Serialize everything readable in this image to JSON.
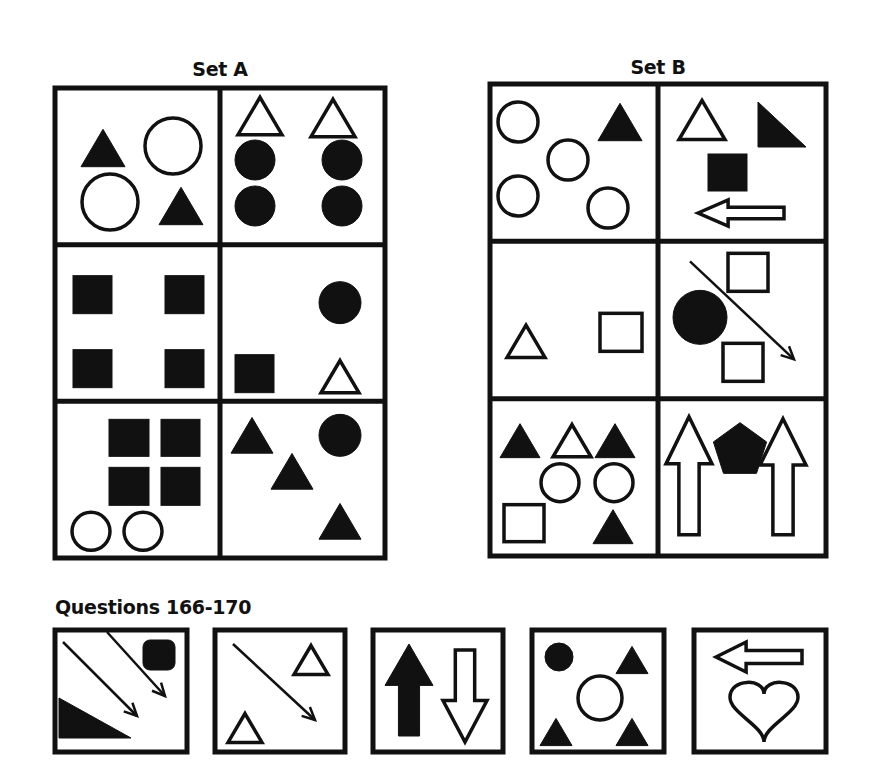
{
  "set_a": {
    "title": "Set A",
    "box": {
      "x": 55,
      "y": 88,
      "w": 330,
      "h": 470
    },
    "panels": [
      {
        "name": "a1",
        "shapes": [
          {
            "t": "tri",
            "cx": 48,
            "cy": 60,
            "s": 44,
            "fill": true
          },
          {
            "t": "circle",
            "cx": 118,
            "cy": 58,
            "r": 28,
            "fill": false
          },
          {
            "t": "circle",
            "cx": 55,
            "cy": 114,
            "r": 28,
            "fill": false
          },
          {
            "t": "tri",
            "cx": 126,
            "cy": 118,
            "s": 44,
            "fill": true
          }
        ]
      },
      {
        "name": "a2",
        "shapes": [
          {
            "t": "tri",
            "cx": 40,
            "cy": 28,
            "s": 44,
            "fill": false
          },
          {
            "t": "tri",
            "cx": 113,
            "cy": 30,
            "s": 44,
            "fill": false
          },
          {
            "t": "circle",
            "cx": 35,
            "cy": 72,
            "r": 20,
            "fill": true
          },
          {
            "t": "circle",
            "cx": 122,
            "cy": 72,
            "r": 20,
            "fill": true
          },
          {
            "t": "circle",
            "cx": 35,
            "cy": 118,
            "r": 20,
            "fill": true
          },
          {
            "t": "circle",
            "cx": 122,
            "cy": 118,
            "r": 20,
            "fill": true
          }
        ]
      },
      {
        "name": "a3",
        "shapes": [
          {
            "t": "rect",
            "x": 18,
            "y": 31,
            "w": 39,
            "h": 38,
            "fill": true
          },
          {
            "t": "rect",
            "x": 110,
            "y": 31,
            "w": 39,
            "h": 38,
            "fill": true
          },
          {
            "t": "rect",
            "x": 18,
            "y": 105,
            "w": 39,
            "h": 38,
            "fill": true
          },
          {
            "t": "rect",
            "x": 110,
            "y": 105,
            "w": 39,
            "h": 38,
            "fill": true
          }
        ]
      },
      {
        "name": "a4",
        "shapes": [
          {
            "t": "circle",
            "cx": 120,
            "cy": 58,
            "r": 21,
            "fill": true
          },
          {
            "t": "rect",
            "x": 15,
            "y": 110,
            "w": 39,
            "h": 38,
            "fill": true
          },
          {
            "t": "tri",
            "cx": 120,
            "cy": 132,
            "s": 38,
            "fill": false
          }
        ]
      },
      {
        "name": "a5",
        "shapes": [
          {
            "t": "rect",
            "x": 54,
            "y": 18,
            "w": 40,
            "h": 37,
            "fill": true
          },
          {
            "t": "rect",
            "x": 106,
            "y": 18,
            "w": 39,
            "h": 37,
            "fill": true
          },
          {
            "t": "rect",
            "x": 54,
            "y": 66,
            "w": 40,
            "h": 38,
            "fill": true
          },
          {
            "t": "rect",
            "x": 106,
            "y": 66,
            "w": 39,
            "h": 38,
            "fill": true
          },
          {
            "t": "circle",
            "cx": 36,
            "cy": 130,
            "r": 19,
            "fill": false
          },
          {
            "t": "circle",
            "cx": 88,
            "cy": 130,
            "r": 19,
            "fill": false
          }
        ]
      },
      {
        "name": "a6",
        "shapes": [
          {
            "t": "tri",
            "cx": 32,
            "cy": 34,
            "s": 42,
            "fill": true
          },
          {
            "t": "circle",
            "cx": 120,
            "cy": 34,
            "r": 21,
            "fill": true
          },
          {
            "t": "tri",
            "cx": 72,
            "cy": 70,
            "s": 42,
            "fill": true
          },
          {
            "t": "tri",
            "cx": 120,
            "cy": 120,
            "s": 42,
            "fill": true
          }
        ]
      }
    ]
  },
  "set_b": {
    "title": "Set B",
    "box": {
      "x": 490,
      "y": 84,
      "w": 336,
      "h": 472
    },
    "panels": [
      {
        "name": "b1",
        "shapes": [
          {
            "t": "circle",
            "cx": 28,
            "cy": 38,
            "r": 20,
            "fill": false
          },
          {
            "t": "tri",
            "cx": 130,
            "cy": 38,
            "s": 44,
            "fill": true
          },
          {
            "t": "circle",
            "cx": 78,
            "cy": 76,
            "r": 20,
            "fill": false
          },
          {
            "t": "circle",
            "cx": 28,
            "cy": 112,
            "r": 20,
            "fill": false
          },
          {
            "t": "circle",
            "cx": 118,
            "cy": 124,
            "r": 20,
            "fill": false
          }
        ]
      },
      {
        "name": "b2",
        "shapes": [
          {
            "t": "tri",
            "cx": 44,
            "cy": 36,
            "s": 46,
            "fill": false
          },
          {
            "t": "rtri",
            "x": 100,
            "y": 18,
            "w": 48,
            "h": 45,
            "fill": true
          },
          {
            "t": "rect",
            "x": 50,
            "y": 70,
            "w": 39,
            "h": 37,
            "fill": true
          },
          {
            "t": "arrow_left_outline",
            "x": 40,
            "y": 116,
            "w": 86,
            "h": 26
          }
        ]
      },
      {
        "name": "b3",
        "shapes": [
          {
            "t": "tri",
            "cx": 36,
            "cy": 100,
            "s": 38,
            "fill": false
          },
          {
            "t": "rect",
            "x": 110,
            "y": 72,
            "w": 42,
            "h": 38,
            "fill": false
          }
        ]
      },
      {
        "name": "b4",
        "shapes": [
          {
            "t": "rect",
            "x": 70,
            "y": 12,
            "w": 40,
            "h": 38,
            "fill": false
          },
          {
            "t": "circle",
            "cx": 42,
            "cy": 76,
            "r": 27,
            "fill": true
          },
          {
            "t": "line_arrow",
            "x1": 32,
            "y1": 20,
            "x2": 136,
            "y2": 118
          },
          {
            "t": "rect",
            "x": 65,
            "y": 102,
            "w": 40,
            "h": 38,
            "fill": false
          }
        ]
      },
      {
        "name": "b5",
        "shapes": [
          {
            "t": "tri",
            "cx": 30,
            "cy": 42,
            "s": 40,
            "fill": true
          },
          {
            "t": "tri",
            "cx": 82,
            "cy": 42,
            "s": 38,
            "fill": false
          },
          {
            "t": "tri",
            "cx": 125,
            "cy": 42,
            "s": 40,
            "fill": true
          },
          {
            "t": "circle",
            "cx": 70,
            "cy": 84,
            "r": 19,
            "fill": false
          },
          {
            "t": "circle",
            "cx": 124,
            "cy": 84,
            "r": 19,
            "fill": false
          },
          {
            "t": "rect",
            "x": 14,
            "y": 106,
            "w": 40,
            "h": 37,
            "fill": false
          },
          {
            "t": "tri",
            "cx": 123,
            "cy": 128,
            "s": 40,
            "fill": true
          }
        ]
      },
      {
        "name": "b6",
        "shapes": [
          {
            "t": "arrow_up_outline",
            "x": 8,
            "y": 18,
            "w": 46,
            "h": 118
          },
          {
            "t": "pentagon",
            "cx": 82,
            "cy": 52,
            "r": 28,
            "fill": true
          },
          {
            "t": "arrow_up_outline",
            "x": 102,
            "y": 20,
            "w": 46,
            "h": 116
          }
        ]
      }
    ]
  },
  "questions": {
    "title": "Questions 166-170",
    "items": [
      {
        "number": 166,
        "box": {
          "x": 55,
          "y": 630,
          "w": 132,
          "h": 122
        },
        "shapes": [
          {
            "t": "line_arrow",
            "x1": 8,
            "y1": 12,
            "x2": 82,
            "y2": 86
          },
          {
            "t": "line_arrow",
            "x1": 52,
            "y1": 2,
            "x2": 110,
            "y2": 66
          },
          {
            "t": "rrect",
            "x": 88,
            "y": 10,
            "w": 32,
            "h": 30,
            "fill": true
          },
          {
            "t": "rtri_bl",
            "x": 4,
            "y": 68,
            "w": 72,
            "h": 40,
            "fill": true
          }
        ]
      },
      {
        "number": 167,
        "box": {
          "x": 215,
          "y": 630,
          "w": 130,
          "h": 122
        },
        "shapes": [
          {
            "t": "line_arrow",
            "x1": 18,
            "y1": 14,
            "x2": 100,
            "y2": 90
          },
          {
            "t": "tri",
            "cx": 96,
            "cy": 30,
            "s": 34,
            "fill": false
          },
          {
            "t": "tri",
            "cx": 30,
            "cy": 98,
            "s": 34,
            "fill": false
          }
        ]
      },
      {
        "number": 168,
        "box": {
          "x": 373,
          "y": 630,
          "w": 130,
          "h": 122
        },
        "shapes": [
          {
            "t": "arrow_up_filled",
            "x": 12,
            "y": 14,
            "w": 48,
            "h": 92
          },
          {
            "t": "arrow_down_outline",
            "x": 70,
            "y": 20,
            "w": 44,
            "h": 92
          }
        ]
      },
      {
        "number": 169,
        "box": {
          "x": 532,
          "y": 630,
          "w": 132,
          "h": 122
        },
        "shapes": [
          {
            "t": "circle",
            "cx": 27,
            "cy": 27,
            "r": 14,
            "fill": true
          },
          {
            "t": "tri",
            "cx": 100,
            "cy": 30,
            "s": 32,
            "fill": true
          },
          {
            "t": "circle",
            "cx": 68,
            "cy": 68,
            "r": 22,
            "fill": false
          },
          {
            "t": "tri",
            "cx": 24,
            "cy": 102,
            "s": 32,
            "fill": true
          },
          {
            "t": "tri",
            "cx": 100,
            "cy": 102,
            "s": 32,
            "fill": true
          }
        ]
      },
      {
        "number": 170,
        "box": {
          "x": 694,
          "y": 630,
          "w": 132,
          "h": 122
        },
        "shapes": [
          {
            "t": "arrow_left_outline",
            "x": 22,
            "y": 12,
            "w": 86,
            "h": 30
          },
          {
            "t": "heart",
            "cx": 70,
            "cy": 80,
            "w": 68,
            "h": 64
          }
        ]
      }
    ]
  },
  "colors": {
    "ink": "#111111",
    "background": "#ffffff"
  }
}
